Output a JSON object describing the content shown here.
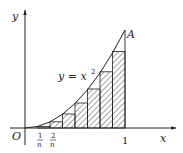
{
  "diagram": {
    "axes": {
      "x_label": "x",
      "y_label": "y",
      "origin_label": "O"
    },
    "curve": {
      "label_main": "y = x",
      "label_exp": "2",
      "endpoint_label": "A"
    },
    "ticks": {
      "one": "1",
      "frac1_num": "1",
      "frac1_den": "n",
      "frac2_num": "2",
      "frac2_den": "n"
    },
    "subdivisions": 8,
    "colors": {
      "stroke": "#222222",
      "hatch": "#333333",
      "background": "#ffffff"
    }
  }
}
